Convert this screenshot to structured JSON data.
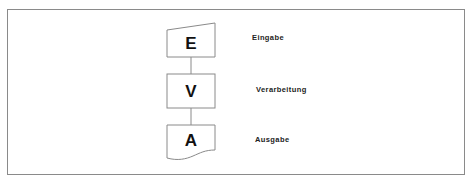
{
  "diagram": {
    "type": "flowchart",
    "nodes": [
      {
        "id": "E",
        "letter": "E",
        "shape": "manual-input",
        "label": "Eingabe"
      },
      {
        "id": "V",
        "letter": "V",
        "shape": "process",
        "label": "Verarbeitung"
      },
      {
        "id": "A",
        "letter": "A",
        "shape": "document",
        "label": "Ausgabe"
      }
    ],
    "edges": [
      {
        "from": "E",
        "to": "V"
      },
      {
        "from": "V",
        "to": "A"
      }
    ],
    "colors": {
      "stroke": "#8a8a8a",
      "text": "#111111",
      "background": "#ffffff"
    }
  }
}
